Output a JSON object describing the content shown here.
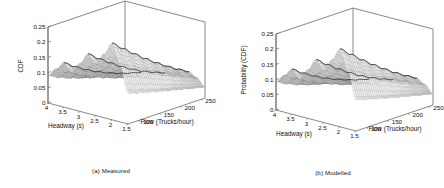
{
  "figure": {
    "panels": [
      {
        "id": "measured",
        "caption": "(a) Measured",
        "zlabel": "CDF",
        "xlabel": "Headway (s)",
        "ylabel": "Flow (Trucks/hour)"
      },
      {
        "id": "modelled",
        "caption": "(b) Modelled",
        "zlabel": "Probability (CDF)",
        "xlabel": "Headway (s)",
        "ylabel": "Flow (Trucks/hour)"
      }
    ]
  },
  "chart_data": [
    {
      "type": "surface",
      "title": "(a) Measured",
      "xlabel": "Headway (s)",
      "ylabel": "Flow (Trucks/hour)",
      "zlabel": "CDF",
      "xticks": [
        4,
        3.5,
        3,
        2.5,
        2,
        1.5
      ],
      "yticks": [
        100,
        150,
        200,
        250
      ],
      "zticks": [
        0,
        0.05,
        0.1,
        0.15,
        0.2,
        0.25
      ],
      "xlim": [
        1.5,
        4
      ],
      "ylim": [
        75,
        260
      ],
      "zlim": [
        0,
        0.25
      ],
      "grid": false,
      "legend": null,
      "colormap": "gray",
      "mesh_style": "wireframe-shaded",
      "x": [
        4.0,
        3.75,
        3.5,
        3.25,
        3.0,
        2.75,
        2.5,
        2.25,
        2.0,
        1.75,
        1.5
      ],
      "y": [
        75,
        100,
        125,
        150,
        175,
        200,
        225,
        250
      ],
      "z": [
        [
          0.09,
          0.072,
          0.058,
          0.046,
          0.036,
          0.028,
          0.021,
          0.016
        ],
        [
          0.118,
          0.096,
          0.078,
          0.062,
          0.049,
          0.038,
          0.029,
          0.022
        ],
        [
          0.146,
          0.121,
          0.099,
          0.08,
          0.064,
          0.05,
          0.039,
          0.029
        ],
        [
          0.119,
          0.1,
          0.083,
          0.068,
          0.055,
          0.044,
          0.034,
          0.026
        ],
        [
          0.158,
          0.134,
          0.112,
          0.092,
          0.075,
          0.06,
          0.047,
          0.036
        ],
        [
          0.196,
          0.168,
          0.142,
          0.118,
          0.097,
          0.078,
          0.062,
          0.048
        ],
        [
          0.168,
          0.146,
          0.125,
          0.105,
          0.087,
          0.071,
          0.056,
          0.043
        ],
        [
          0.21,
          0.184,
          0.159,
          0.135,
          0.113,
          0.093,
          0.074,
          0.058
        ],
        [
          0.252,
          0.222,
          0.193,
          0.165,
          0.139,
          0.115,
          0.093,
          0.073
        ],
        [
          0.19,
          0.17,
          0.15,
          0.13,
          0.111,
          0.093,
          0.076,
          0.06
        ],
        [
          0.1,
          0.09,
          0.081,
          0.071,
          0.062,
          0.053,
          0.044,
          0.036
        ]
      ],
      "notes": "Measured empirical CDF surface; three ridge crests along the flow axis, noisy/irregular mesh, CDF decays as flow increases."
    },
    {
      "type": "surface",
      "title": "(b) Modelled",
      "xlabel": "Headway (s)",
      "ylabel": "Flow (Trucks/hour)",
      "zlabel": "Probability (CDF)",
      "xticks": [
        4,
        3.5,
        3,
        2.5,
        2,
        1.5
      ],
      "yticks": [
        100,
        150,
        200,
        250
      ],
      "zticks": [
        0,
        0.05,
        0.1,
        0.15,
        0.2,
        0.25
      ],
      "xlim": [
        1.5,
        4
      ],
      "ylim": [
        75,
        260
      ],
      "zlim": [
        0,
        0.25
      ],
      "grid": false,
      "legend": null,
      "colormap": "gray",
      "mesh_style": "wireframe-shaded",
      "x": [
        4.0,
        3.75,
        3.5,
        3.25,
        3.0,
        2.75,
        2.5,
        2.25,
        2.0,
        1.75,
        1.5
      ],
      "y": [
        75,
        100,
        125,
        150,
        175,
        200,
        225,
        250
      ],
      "z": [
        [
          0.092,
          0.074,
          0.059,
          0.047,
          0.037,
          0.029,
          0.022,
          0.017
        ],
        [
          0.12,
          0.098,
          0.08,
          0.064,
          0.051,
          0.04,
          0.031,
          0.023
        ],
        [
          0.148,
          0.123,
          0.101,
          0.082,
          0.066,
          0.052,
          0.04,
          0.03
        ],
        [
          0.121,
          0.102,
          0.085,
          0.07,
          0.056,
          0.045,
          0.035,
          0.027
        ],
        [
          0.16,
          0.136,
          0.114,
          0.094,
          0.077,
          0.062,
          0.048,
          0.037
        ],
        [
          0.2,
          0.172,
          0.145,
          0.121,
          0.099,
          0.08,
          0.063,
          0.049
        ],
        [
          0.17,
          0.148,
          0.127,
          0.107,
          0.089,
          0.072,
          0.057,
          0.044
        ],
        [
          0.214,
          0.188,
          0.162,
          0.138,
          0.115,
          0.095,
          0.076,
          0.059
        ],
        [
          0.256,
          0.226,
          0.196,
          0.168,
          0.142,
          0.117,
          0.095,
          0.075
        ],
        [
          0.192,
          0.172,
          0.152,
          0.132,
          0.113,
          0.095,
          0.077,
          0.061
        ],
        [
          0.102,
          0.092,
          0.082,
          0.072,
          0.063,
          0.054,
          0.045,
          0.037
        ]
      ],
      "notes": "Modelled analytical CDF surface; same three ridges but smooth regular mesh, matching the measured surface shape."
    }
  ]
}
